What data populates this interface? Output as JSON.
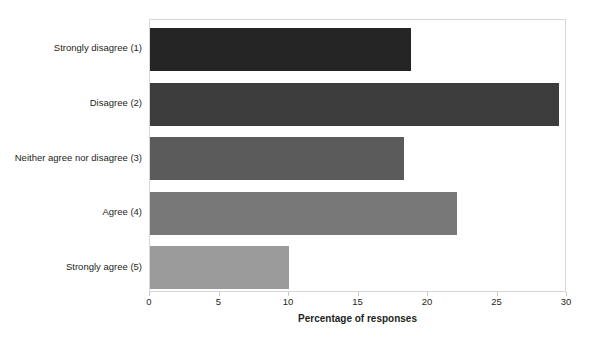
{
  "chart_data": {
    "type": "bar",
    "orientation": "horizontal",
    "title": "",
    "xlabel": "Percentage of responses",
    "ylabel": "",
    "categories": [
      "Strongly disagree (1)",
      "Disagree (2)",
      "Neither agree nor disagree (3)",
      "Agree (4)",
      "Strongly agree (5)"
    ],
    "values": [
      18.8,
      29.4,
      18.3,
      22.1,
      10.0
    ],
    "xlim": [
      0,
      30
    ],
    "xticks": [
      0,
      5,
      10,
      15,
      20,
      25,
      30
    ],
    "xtick_labels": [
      "0",
      "5",
      "10",
      "15",
      "20",
      "25",
      "30"
    ],
    "grid": false,
    "legend": "none",
    "bar_colors": [
      "#252525",
      "#3c3c3c",
      "#5b5b5b",
      "#787878",
      "#9b9b9b"
    ],
    "plot_border_color": "#d7d7d7",
    "background_color": "#ffffff"
  }
}
